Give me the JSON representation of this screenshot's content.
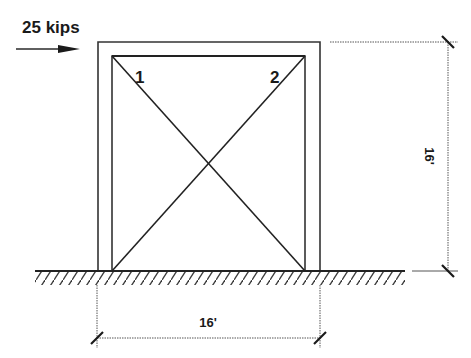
{
  "load": {
    "label": "25 kips",
    "direction": "right"
  },
  "members": {
    "brace_1_label": "1",
    "brace_2_label": "2"
  },
  "dimensions": {
    "height_label": "16'",
    "width_label": "16'"
  },
  "colors": {
    "line": "#2a2a2a",
    "background": "#ffffff"
  }
}
